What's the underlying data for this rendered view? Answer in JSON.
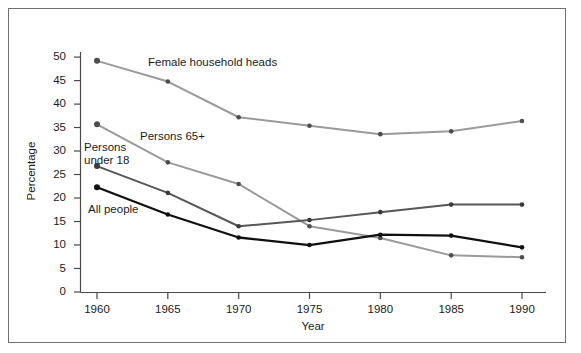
{
  "chart_data": {
    "type": "line",
    "title": "",
    "xlabel": "Year",
    "ylabel": "Percentage",
    "categories": [
      1960,
      1965,
      1970,
      1975,
      1980,
      1985,
      1990
    ],
    "x": [
      1960,
      1965,
      1970,
      1975,
      1980,
      1985,
      1990
    ],
    "xlim": [
      1958,
      1992
    ],
    "ylim": [
      0,
      52
    ],
    "yticks": [
      0,
      5,
      10,
      15,
      20,
      25,
      30,
      35,
      40,
      45,
      50
    ],
    "xticks": [
      1960,
      1965,
      1970,
      1975,
      1980,
      1985,
      1990
    ],
    "grid": false,
    "legend": "inline-annotations",
    "series": [
      {
        "name": "Female household heads",
        "color": "#9a9a9a",
        "values": [
          49.2,
          44.8,
          37.2,
          35.4,
          33.6,
          34.2,
          36.4
        ]
      },
      {
        "name": "Persons 65+",
        "color": "#9a9a9a",
        "values": [
          35.7,
          27.6,
          23.0,
          14.0,
          11.5,
          7.8,
          7.4
        ]
      },
      {
        "name": "Persons under 18",
        "color": "#575757",
        "values": [
          26.8,
          21.1,
          14.0,
          15.3,
          17.0,
          18.6,
          18.6
        ]
      },
      {
        "name": "All people",
        "color": "#101010",
        "values": [
          22.3,
          16.5,
          11.6,
          10.0,
          12.2,
          12.0,
          9.5
        ]
      }
    ],
    "annotations": [
      {
        "text": "Female household heads",
        "x": 1969.2,
        "y": 46.4
      },
      {
        "text": "Persons 65+",
        "x": 1964.1,
        "y": 30.8
      },
      {
        "text": "Persons under 18",
        "x": 1959.4,
        "y": 29.0
      },
      {
        "text": "All people",
        "x": 1959.8,
        "y": 19.2
      }
    ]
  },
  "axes": {
    "ytick_labels": [
      "50",
      "45",
      "40",
      "35",
      "30",
      "25",
      "20",
      "15",
      "10",
      "5",
      "0"
    ],
    "xtick_labels": [
      "1960",
      "1965",
      "1970",
      "1975",
      "1980",
      "1985",
      "1990"
    ],
    "y_title": "Percentage",
    "x_title": "Year"
  },
  "series_labels": {
    "female_household_heads": "Female household heads",
    "persons_65_plus": "Persons 65+",
    "persons_under_18_line1": "Persons",
    "persons_under_18_line2": "under 18",
    "all_people": "All people"
  },
  "colors": {
    "frame": "#6f6f6f",
    "axis": "#4a4a4a",
    "light_gray_series": "#9a9a9a",
    "mid_gray_series": "#575757",
    "black_series": "#101010",
    "text": "#1c1c1c",
    "background": "#ffffff"
  }
}
